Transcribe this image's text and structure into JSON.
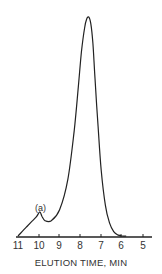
{
  "chart_data": {
    "type": "line",
    "title": "",
    "xlabel": "ELUTION TIME, MIN",
    "ylabel": "",
    "x_reversed": true,
    "xlim": [
      11,
      5
    ],
    "ticks": [
      "11",
      "10",
      "9",
      "8",
      "7",
      "6",
      "5"
    ],
    "grid": false,
    "legend": null,
    "series": [
      {
        "name": "chromatogram",
        "x": [
          11.0,
          10.6,
          10.3,
          10.1,
          9.95,
          9.85,
          9.7,
          9.4,
          9.0,
          8.6,
          8.3,
          8.1,
          7.95,
          7.8,
          7.7,
          7.6,
          7.5,
          7.4,
          7.3,
          7.15,
          7.0,
          6.8,
          6.6,
          6.4,
          6.2,
          6.0,
          5.8
        ],
        "y": [
          0.0,
          0.04,
          0.07,
          0.09,
          0.11,
          0.09,
          0.07,
          0.07,
          0.12,
          0.26,
          0.48,
          0.68,
          0.84,
          0.95,
          0.99,
          1.0,
          0.97,
          0.88,
          0.72,
          0.5,
          0.3,
          0.14,
          0.06,
          0.02,
          0.005,
          0.0,
          0.0
        ]
      }
    ],
    "annotations": [
      {
        "text": "(a)",
        "x": 9.9,
        "y": 0.11
      }
    ]
  }
}
